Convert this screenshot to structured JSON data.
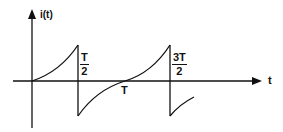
{
  "diagram": {
    "type": "waveform",
    "axes": {
      "y_label": "i(t)",
      "x_label": "t"
    },
    "tick_labels": {
      "half_period": {
        "num": "T",
        "den": "2"
      },
      "period": "T",
      "three_half_period": {
        "num": "3T",
        "den": "2"
      }
    },
    "colors": {
      "stroke": "#111111",
      "background": "#ffffff"
    }
  }
}
